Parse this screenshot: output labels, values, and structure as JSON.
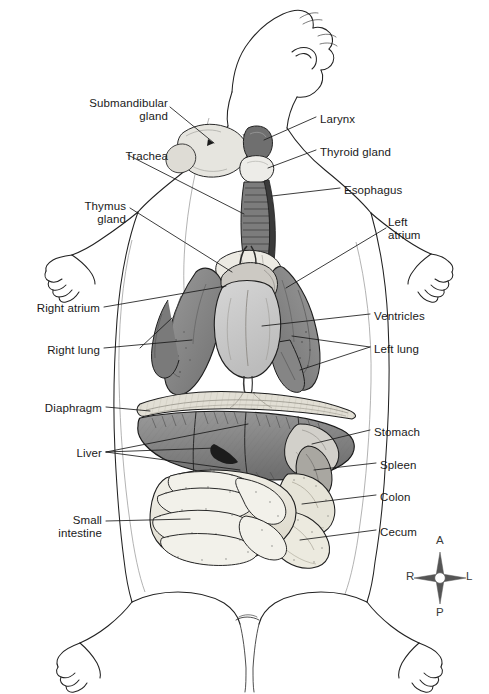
{
  "figure": {
    "background_color": "#ffffff",
    "ink_color": "#1a1a1a",
    "label_font_size_px": 11.5
  },
  "palette": {
    "outline": "#1a1a1a",
    "lung": "#8a8a8a",
    "lung_dark": "#6e6e6e",
    "heart": "#c9c9c9",
    "heart_shade": "#b0b0b0",
    "liver": "#8f8f8f",
    "liver_dark": "#6a6a6a",
    "stomach": "#cfcfcf",
    "spleen": "#a8a8a8",
    "intestine": "#efeee6",
    "intestine_shade": "#dedbcd",
    "colon": "#e4e2d6",
    "trachea": "#7d7d7d",
    "esophagus": "#3d3d3d",
    "gland": "#e3e2dc",
    "thyroid": "#ededeb",
    "diaphragm": "#dedbd2"
  },
  "labels_left": [
    {
      "name": "submandibular-gland",
      "text": "Submandibular\ngland",
      "x": 58,
      "y": 97,
      "w": 110,
      "align": "right"
    },
    {
      "name": "trachea",
      "text": "Trachea",
      "x": 58,
      "y": 150,
      "w": 110,
      "align": "right"
    },
    {
      "name": "thymus-gland",
      "text": "Thymus\ngland",
      "x": 38,
      "y": 200,
      "w": 88,
      "align": "right"
    },
    {
      "name": "right-atrium",
      "text": "Right atrium",
      "x": 10,
      "y": 302,
      "w": 90,
      "align": "right"
    },
    {
      "name": "right-lung",
      "text": "Right lung",
      "x": 20,
      "y": 344,
      "w": 80,
      "align": "right"
    },
    {
      "name": "diaphragm",
      "text": "Diaphragm",
      "x": 16,
      "y": 402,
      "w": 86,
      "align": "right"
    },
    {
      "name": "liver",
      "text": "Liver",
      "x": 46,
      "y": 447,
      "w": 56,
      "align": "right"
    },
    {
      "name": "small-intestine",
      "text": "Small\nintestine",
      "x": 30,
      "y": 514,
      "w": 72,
      "align": "right"
    }
  ],
  "labels_right": [
    {
      "name": "larynx",
      "text": "Larynx",
      "x": 320,
      "y": 113,
      "align": "left"
    },
    {
      "name": "thyroid-gland",
      "text": "Thyroid gland",
      "x": 320,
      "y": 146,
      "align": "left"
    },
    {
      "name": "esophagus",
      "text": "Esophagus",
      "x": 344,
      "y": 184,
      "align": "left"
    },
    {
      "name": "left-atrium",
      "text": "Left\natrium",
      "x": 388,
      "y": 216,
      "align": "left"
    },
    {
      "name": "ventricles",
      "text": "Ventricles",
      "x": 374,
      "y": 310,
      "align": "left"
    },
    {
      "name": "left-lung",
      "text": "Left lung",
      "x": 374,
      "y": 343,
      "align": "left"
    },
    {
      "name": "stomach",
      "text": "Stomach",
      "x": 374,
      "y": 426,
      "align": "left"
    },
    {
      "name": "spleen",
      "text": "Spleen",
      "x": 380,
      "y": 459,
      "align": "left"
    },
    {
      "name": "colon",
      "text": "Colon",
      "x": 380,
      "y": 491,
      "align": "left"
    },
    {
      "name": "cecum",
      "text": "Cecum",
      "x": 380,
      "y": 526,
      "align": "left"
    }
  ],
  "compass": {
    "name": "orientation-compass",
    "center_x": 440,
    "center_y": 578,
    "anterior": "A",
    "posterior": "P",
    "right": "R",
    "left": "L"
  }
}
